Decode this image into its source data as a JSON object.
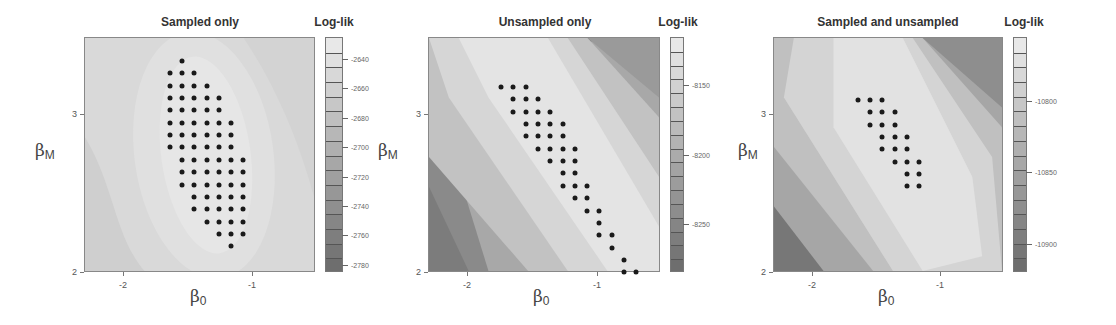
{
  "chart_data": [
    {
      "type": "heatmap",
      "title": "Sampled only",
      "colorbar_title": "Log-lik",
      "xlabel": "β0",
      "ylabel": "βM",
      "xlim": [
        -2.3,
        -0.51
      ],
      "ylim": [
        2,
        3.49
      ],
      "x_ticks": [
        "-2",
        "-1"
      ],
      "y_ticks": [
        "2",
        "3"
      ],
      "colorbar_ticks": [
        "-2640",
        "-2660",
        "-2680",
        "-2700",
        "-2720",
        "-2740",
        "-2760",
        "-2780"
      ],
      "colorbar_range": [
        -2785,
        -2625
      ],
      "overlay_points_description": "grid of sampled (β0, βM) points shown as black dots",
      "overlay_rows": [
        [
          1
        ],
        [
          0,
          1,
          2
        ],
        [
          0,
          1,
          2,
          3
        ],
        [
          0,
          1,
          2,
          3,
          4
        ],
        [
          0,
          1,
          2,
          3,
          4
        ],
        [
          0,
          1,
          2,
          3,
          4,
          5
        ],
        [
          0,
          1,
          2,
          3,
          4,
          5
        ],
        [
          0,
          1,
          2,
          3,
          4,
          5
        ],
        [
          1,
          2,
          3,
          4,
          5,
          6
        ],
        [
          1,
          2,
          3,
          4,
          5,
          6
        ],
        [
          1,
          2,
          3,
          4,
          5,
          6
        ],
        [
          2,
          3,
          4,
          5,
          6
        ],
        [
          2,
          3,
          4,
          5,
          6
        ],
        [
          3,
          4,
          5,
          6
        ],
        [
          4,
          5,
          6
        ],
        [
          5
        ]
      ]
    },
    {
      "type": "heatmap",
      "title": "Unsampled only",
      "colorbar_title": "Log-lik",
      "xlabel": "β0",
      "ylabel": "βM",
      "xlim": [
        -2.3,
        -0.51
      ],
      "ylim": [
        2,
        3.49
      ],
      "x_ticks": [
        "-2",
        "-1"
      ],
      "y_ticks": [
        "2",
        "3"
      ],
      "colorbar_ticks": [
        "-8150",
        "-8200",
        "-8250"
      ],
      "colorbar_range": [
        -8285,
        -8115
      ],
      "overlay_rows": [
        [
          0,
          1,
          2
        ],
        [
          1,
          2,
          3
        ],
        [
          1,
          2,
          3,
          4
        ],
        [
          2,
          3,
          4,
          5
        ],
        [
          2,
          3,
          4,
          5
        ],
        [
          3,
          4,
          5,
          6
        ],
        [
          4,
          5,
          6
        ],
        [
          5,
          6
        ],
        [
          5,
          6,
          7
        ],
        [
          6,
          7
        ],
        [
          7,
          8
        ],
        [
          8
        ],
        [
          8,
          9
        ],
        [
          9
        ],
        [
          10
        ],
        [
          10,
          11
        ]
      ]
    },
    {
      "type": "heatmap",
      "title": "Sampled and unsampled",
      "colorbar_title": "Log-lik",
      "xlabel": "β0",
      "ylabel": "βM",
      "xlim": [
        -2.3,
        -0.51
      ],
      "ylim": [
        2,
        3.49
      ],
      "x_ticks": [
        "-2",
        "-1"
      ],
      "y_ticks": [
        "2",
        "3"
      ],
      "colorbar_ticks": [
        "-10800",
        "-10850",
        "-10900"
      ],
      "colorbar_range": [
        -10920,
        -10755
      ],
      "overlay_rows": [
        [
          0,
          1,
          2
        ],
        [
          1,
          2,
          3
        ],
        [
          1,
          2,
          3
        ],
        [
          2,
          3,
          4
        ],
        [
          2,
          3,
          4
        ],
        [
          3,
          4,
          5
        ],
        [
          4,
          5
        ],
        [
          4,
          5
        ]
      ]
    }
  ],
  "panels": [
    {
      "title": "Sampled only",
      "cb_title": "Log-lik",
      "xlabel": "β",
      "xlabel_sub": "0",
      "ylabel": "β",
      "ylabel_sub": "M",
      "xticks": [
        {
          "v": "-2"
        },
        {
          "v": "-1"
        }
      ],
      "yticks": [
        {
          "v": "3"
        },
        {
          "v": "2"
        }
      ],
      "cb_ticks": [
        "-2640",
        "-2660",
        "-2680",
        "-2700",
        "-2720",
        "-2740",
        "-2760",
        "-2780"
      ]
    },
    {
      "title": "Unsampled only",
      "cb_title": "Log-lik",
      "xlabel": "β",
      "xlabel_sub": "0",
      "ylabel": "β",
      "ylabel_sub": "M",
      "xticks": [
        {
          "v": "-2"
        },
        {
          "v": "-1"
        }
      ],
      "yticks": [
        {
          "v": "3"
        },
        {
          "v": "2"
        }
      ],
      "cb_ticks": [
        "-8150",
        "-8200",
        "-8250"
      ]
    },
    {
      "title": "Sampled and unsampled",
      "cb_title": "Log-lik",
      "xlabel": "β",
      "xlabel_sub": "0",
      "ylabel": "β",
      "ylabel_sub": "M",
      "xticks": [
        {
          "v": "-2"
        },
        {
          "v": "-1"
        }
      ],
      "yticks": [
        {
          "v": "3"
        },
        {
          "v": "2"
        }
      ],
      "cb_ticks": [
        "-10800",
        "-10850",
        "-10900"
      ]
    }
  ],
  "colors": {
    "dot": "#1a1a1a",
    "light": "#e6e6e6",
    "dark": "#6e6e6e"
  }
}
